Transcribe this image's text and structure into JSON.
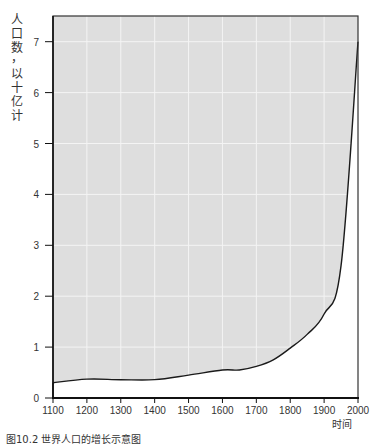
{
  "chart_data": {
    "type": "area",
    "title": "",
    "caption": "图10.2 世界人口的增长示意图",
    "xlabel": "时间",
    "ylabel": "人口数，以十亿计",
    "x": [
      1100,
      1200,
      1300,
      1400,
      1500,
      1600,
      1650,
      1700,
      1750,
      1800,
      1850,
      1900,
      1950,
      2000
    ],
    "values": [
      0.3,
      0.37,
      0.36,
      0.36,
      0.45,
      0.55,
      0.55,
      0.62,
      0.75,
      0.98,
      1.25,
      1.65,
      2.6,
      7.0
    ],
    "xlim": [
      1100,
      2000
    ],
    "ylim": [
      0,
      7.5
    ],
    "xticks": [
      "1100",
      "1200",
      "1300",
      "1400",
      "1500",
      "1600",
      "1700",
      "1800",
      "1900",
      "2000"
    ],
    "yticks": [
      "0",
      "1",
      "2",
      "3",
      "4",
      "5",
      "6",
      "7"
    ],
    "grid": true,
    "fill_color": "#dedede",
    "grid_color": "#f4f4f4",
    "line_color": "#1a1a1a"
  },
  "labels": {
    "ylabel_chars": [
      "人",
      "口",
      "数",
      "，",
      "以",
      "十",
      "亿",
      "计"
    ],
    "xlabel": "时间",
    "caption": "图10.2  世界人口的增长示意图"
  }
}
